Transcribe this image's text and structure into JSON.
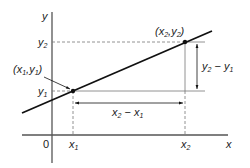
{
  "diagram": {
    "axes": {
      "x_label": "x",
      "y_label": "y",
      "origin_label": "0"
    },
    "points": [
      {
        "name": "point-1",
        "x_sym": "x",
        "x_sub": "1",
        "y_sym": "y",
        "y_sub": "1",
        "label": "(x1,y1)"
      },
      {
        "name": "point-2",
        "x_sym": "x",
        "x_sub": "2",
        "y_sym": "y",
        "y_sub": "2",
        "label": "(x2,y2)"
      }
    ],
    "ticks": {
      "x1": {
        "sym": "x",
        "sub": "1"
      },
      "x2": {
        "sym": "x",
        "sub": "2"
      },
      "y1": {
        "sym": "y",
        "sub": "1"
      },
      "y2": {
        "sym": "y",
        "sub": "2"
      }
    },
    "dimensions": {
      "rise": {
        "a": "y",
        "a_sub": "2",
        "op": " − ",
        "b": "y",
        "b_sub": "1",
        "label": "y2 − y1"
      },
      "run": {
        "a": "x",
        "a_sub": "2",
        "op": " − ",
        "b": "x",
        "b_sub": "1",
        "label": "x2 − x1"
      }
    },
    "colors": {
      "line": "#111111",
      "axis": "#555555",
      "guide": "#777777"
    }
  }
}
